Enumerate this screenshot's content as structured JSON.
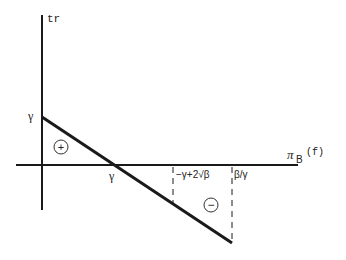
{
  "diagram": {
    "y_axis_label": "tr",
    "x_axis_label_main": "π",
    "x_axis_label_sub": "B",
    "x_axis_label_arg": "(f)",
    "y_intercept_label": "γ",
    "x_intercept_label": "γ",
    "tick1_label": "−γ+2√β",
    "tick2_label": "β/γ",
    "positive_region_label": "+",
    "negative_region_label": "−",
    "colors": {
      "stroke": "#1a1a1a",
      "text": "#222222",
      "background": "#ffffff"
    }
  }
}
